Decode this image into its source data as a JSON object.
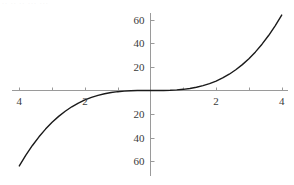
{
  "figure": {
    "artifact_text": "·· ·· ·· ··· ···",
    "width": 294,
    "height": 185,
    "background_color": "#ffffff",
    "axis_color": "#9a9a9a",
    "curve_color": "#1a1a1a",
    "label_color": "#3a3a3a"
  },
  "chart_data": {
    "type": "line",
    "title": "",
    "subtitle": "",
    "xlabel": "",
    "ylabel": "",
    "function": "y = x^3",
    "grid": false,
    "legend": null,
    "xlim": [
      -4.25,
      4.25
    ],
    "ylim": [
      -68,
      68
    ],
    "xticks": [
      -4,
      -3,
      -2,
      -1,
      1,
      2,
      3,
      4
    ],
    "yticks": [
      -60,
      -40,
      -20,
      20,
      40,
      60
    ],
    "x_tick_labels": [
      {
        "value": -4,
        "text": "4"
      },
      {
        "value": -2,
        "text": "2"
      },
      {
        "value": 2,
        "text": "2"
      },
      {
        "value": 4,
        "text": "4"
      }
    ],
    "y_tick_labels": [
      {
        "value": 60,
        "text": "60"
      },
      {
        "value": 40,
        "text": "40"
      },
      {
        "value": 20,
        "text": "20"
      },
      {
        "value": -20,
        "text": "20"
      },
      {
        "value": -40,
        "text": "40"
      },
      {
        "value": -60,
        "text": "60"
      }
    ],
    "x": [
      -4.0,
      -3.8,
      -3.6,
      -3.4,
      -3.2,
      -3.0,
      -2.8,
      -2.6,
      -2.4,
      -2.2,
      -2.0,
      -1.8,
      -1.6,
      -1.4,
      -1.2,
      -1.0,
      -0.8,
      -0.6,
      -0.4,
      -0.2,
      0.0,
      0.2,
      0.4,
      0.6,
      0.8,
      1.0,
      1.2,
      1.4,
      1.6,
      1.8,
      2.0,
      2.2,
      2.4,
      2.6,
      2.8,
      3.0,
      3.2,
      3.4,
      3.6,
      3.8,
      4.0
    ],
    "y": [
      -64.0,
      -54.87,
      -46.66,
      -39.3,
      -32.77,
      -27.0,
      -21.95,
      -17.58,
      -13.82,
      -10.65,
      -8.0,
      -5.83,
      -4.1,
      -2.74,
      -1.73,
      -1.0,
      -0.51,
      -0.22,
      -0.06,
      -0.01,
      0.0,
      0.01,
      0.06,
      0.22,
      0.51,
      1.0,
      1.73,
      2.74,
      4.1,
      5.83,
      8.0,
      10.65,
      13.82,
      17.58,
      21.95,
      27.0,
      32.77,
      39.3,
      46.66,
      54.87,
      64.0
    ]
  }
}
